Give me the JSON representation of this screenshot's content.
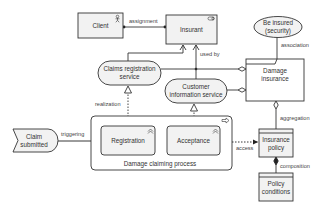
{
  "diagram": {
    "type": "archimate",
    "colors": {
      "fill": "#f2f2f2",
      "stroke": "#333333",
      "text": "#333333",
      "background": "#ffffff"
    },
    "nodes": {
      "client": {
        "label": "Client",
        "kind": "business-actor",
        "icon": "actor-icon"
      },
      "insurant": {
        "label": "Insurant",
        "kind": "business-role",
        "icon": "role-icon"
      },
      "be_insured": {
        "label_line1": "Be insured",
        "label_line2": "(security)",
        "kind": "business-value"
      },
      "claims_registration_service": {
        "label_line1": "Claims registration",
        "label_line2": "service",
        "kind": "business-service"
      },
      "customer_information_service": {
        "label_line1": "Customer",
        "label_line2": "information service",
        "kind": "business-service"
      },
      "damage_insurance": {
        "label_line1": "Damage",
        "label_line2": "insurance",
        "kind": "product"
      },
      "claim_submitted": {
        "label_line1": "Claim",
        "label_line2": "submitted",
        "kind": "business-event"
      },
      "registration": {
        "label": "Registration",
        "kind": "business-process",
        "icon": "function-icon"
      },
      "acceptance": {
        "label": "Acceptance",
        "kind": "business-process",
        "icon": "function-icon"
      },
      "damage_claiming_process": {
        "label": "Damage claiming process",
        "kind": "business-process",
        "icon": "process-arrow-icon"
      },
      "insurance_policy": {
        "label_line1": "Insurance",
        "label_line2": "policy",
        "kind": "business-object"
      },
      "policy_conditions": {
        "label_line1": "Policy",
        "label_line2": "conditions",
        "kind": "business-object"
      }
    },
    "relations": {
      "assignment": "assignment",
      "used_by": "used by",
      "association": "association",
      "realization": "realization",
      "triggering": "triggering",
      "access": "access",
      "aggregation": "aggregation",
      "composition": "composition"
    }
  }
}
